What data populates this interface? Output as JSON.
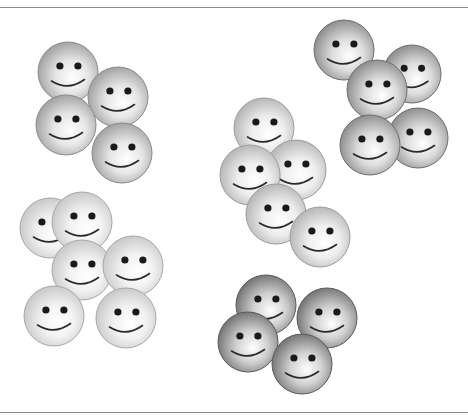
{
  "header": {
    "clipped_text": ""
  },
  "figure": {
    "clusters": [
      {
        "name": "cluster-top-left",
        "shade": "medium",
        "edge_color": "#8a8a8a",
        "faces": [
          {
            "cx": 68,
            "cy": 72,
            "r": 30
          },
          {
            "cx": 118,
            "cy": 97,
            "r": 30
          },
          {
            "cx": 66,
            "cy": 125,
            "r": 30
          },
          {
            "cx": 122,
            "cy": 153,
            "r": 30
          }
        ]
      },
      {
        "name": "cluster-top-right",
        "shade": "dark",
        "edge_color": "#6e6e6e",
        "faces": [
          {
            "cx": 344,
            "cy": 50,
            "r": 30
          },
          {
            "cx": 412,
            "cy": 74,
            "r": 29
          },
          {
            "cx": 377,
            "cy": 90,
            "r": 30
          },
          {
            "cx": 418,
            "cy": 138,
            "r": 30
          },
          {
            "cx": 370,
            "cy": 145,
            "r": 30
          }
        ]
      },
      {
        "name": "cluster-middle",
        "shade": "light",
        "edge_color": "#9c9c9c",
        "faces": [
          {
            "cx": 264,
            "cy": 128,
            "r": 30
          },
          {
            "cx": 296,
            "cy": 170,
            "r": 30
          },
          {
            "cx": 250,
            "cy": 175,
            "r": 30
          },
          {
            "cx": 276,
            "cy": 214,
            "r": 30
          },
          {
            "cx": 320,
            "cy": 237,
            "r": 30
          }
        ]
      },
      {
        "name": "cluster-bottom-left",
        "shade": "lightest",
        "edge_color": "#a8a8a8",
        "faces": [
          {
            "cx": 50,
            "cy": 228,
            "r": 30
          },
          {
            "cx": 82,
            "cy": 222,
            "r": 30
          },
          {
            "cx": 82,
            "cy": 270,
            "r": 30
          },
          {
            "cx": 133,
            "cy": 266,
            "r": 30
          },
          {
            "cx": 54,
            "cy": 316,
            "r": 30
          },
          {
            "cx": 126,
            "cy": 318,
            "r": 30
          }
        ]
      },
      {
        "name": "cluster-bottom-center",
        "shade": "darkest",
        "edge_color": "#5a5a5a",
        "faces": [
          {
            "cx": 266,
            "cy": 305,
            "r": 30
          },
          {
            "cx": 327,
            "cy": 318,
            "r": 30
          },
          {
            "cx": 248,
            "cy": 342,
            "r": 30
          },
          {
            "cx": 302,
            "cy": 364,
            "r": 30
          }
        ]
      }
    ],
    "shades": {
      "lightest": {
        "inner": "#ffffff",
        "mid": "#f2f2f2",
        "outer": "#c4c4c4"
      },
      "light": {
        "inner": "#ffffff",
        "mid": "#eeeeee",
        "outer": "#b0b0b0"
      },
      "medium": {
        "inner": "#ffffff",
        "mid": "#e6e6e6",
        "outer": "#9a9a9a"
      },
      "dark": {
        "inner": "#ffffff",
        "mid": "#dcdcdc",
        "outer": "#858585"
      },
      "darkest": {
        "inner": "#ffffff",
        "mid": "#d0d0d0",
        "outer": "#6a6a6a"
      }
    },
    "feature_color": "#1a1a1a",
    "rule_color": "#8c8c8c"
  }
}
